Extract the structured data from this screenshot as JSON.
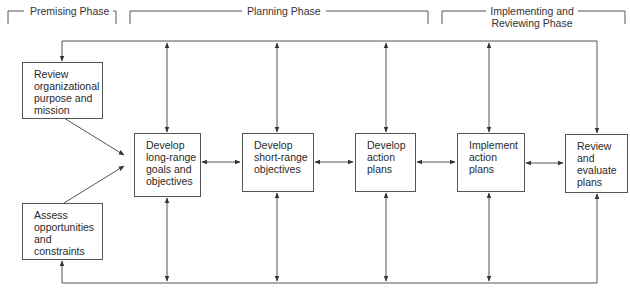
{
  "phases": {
    "premising": "Premising Phase",
    "planning": "Planning Phase",
    "implementing_line1": "Implementing and",
    "implementing_line2": "Reviewing Phase"
  },
  "boxes": {
    "review_purpose": "Review\norganizational\npurpose and\nmission",
    "assess_opportunities": "Assess\nopportunities\nand\nconstraints",
    "long_range": "Develop\nlong-range\ngoals and\nobjectives",
    "short_range": "Develop\nshort-range\nobjectives",
    "action_plans": "Develop\naction\nplans",
    "implement": "Implement\naction\nplans",
    "review_evaluate": "Review\nand\nevaluate\nplans"
  },
  "colors": {
    "line": "#555555",
    "text": "#2a2a2a",
    "background": "#ffffff"
  }
}
